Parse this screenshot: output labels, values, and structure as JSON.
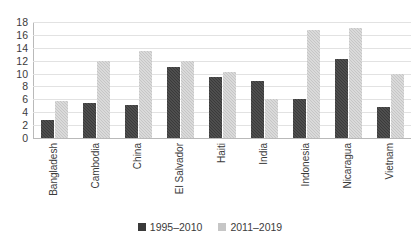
{
  "chart_data": {
    "type": "bar",
    "title": "",
    "subtitle": "",
    "xlabel": "",
    "ylabel": "",
    "ylim": [
      0,
      18
    ],
    "ytick_step": 2,
    "yticks": [
      18,
      16,
      14,
      12,
      10,
      8,
      6,
      4,
      2,
      0
    ],
    "grid": true,
    "legend_position": "bottom-center",
    "categories": [
      "Bangladesh",
      "Cambodia",
      "China",
      "El Salvador",
      "Haiti",
      "India",
      "Indonesia",
      "Nicaragua",
      "Vietnam"
    ],
    "series": [
      {
        "name": "1995–2010",
        "color": "#3a3a3a",
        "values": [
          2.8,
          5.5,
          5.2,
          11.0,
          9.5,
          8.8,
          6.0,
          12.3,
          4.8
        ]
      },
      {
        "name": "2011–2019",
        "color": "#c6c6c6",
        "values": [
          5.8,
          12.0,
          13.5,
          12.0,
          10.2,
          6.0,
          16.8,
          17.0,
          10.0
        ]
      }
    ]
  }
}
